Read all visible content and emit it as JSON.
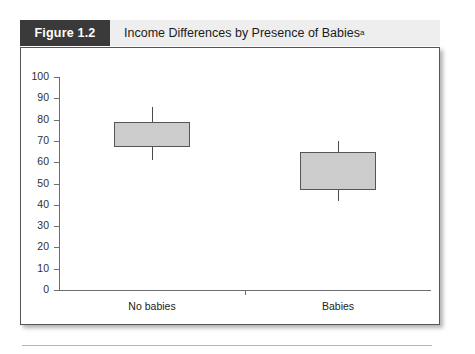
{
  "figure": {
    "tag": "Figure 1.2",
    "title": "Income Differences by Presence of Babies",
    "title_superscript": "a"
  },
  "chart_data": {
    "type": "box",
    "title": "Income Differences by Presence of Babies",
    "xlabel": "",
    "ylabel": "",
    "ylim": [
      0,
      100
    ],
    "ytick_labels": [
      "100",
      "90",
      "80",
      "70",
      "60",
      "50",
      "40",
      "30",
      "20",
      "10",
      "0"
    ],
    "ytick_values": [
      100,
      90,
      80,
      70,
      60,
      50,
      40,
      30,
      20,
      10,
      0
    ],
    "grid": false,
    "legend": "none",
    "categories": [
      "No babies",
      "Babies"
    ],
    "boxes": [
      {
        "category": "No babies",
        "box_low": 67,
        "box_high": 79,
        "whisker_low": 61,
        "whisker_high": 86
      },
      {
        "category": "Babies",
        "box_low": 47,
        "box_high": 65,
        "whisker_low": 42,
        "whisker_high": 70
      }
    ]
  },
  "colors": {
    "tag_background": "#3a3a3a",
    "header_background": "#eeeeee",
    "box_fill": "#cccccc",
    "box_stroke": "#555555",
    "axis": "#6d6d6d"
  }
}
